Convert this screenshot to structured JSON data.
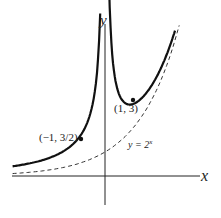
{
  "chart_data": {
    "type": "line",
    "title": "",
    "xlabel": "x",
    "ylabel": "y",
    "grid": false,
    "series": [
      {
        "name": "y = 2^x + 1/x",
        "style": "solid",
        "x": [
          -3.2,
          -3,
          -2.5,
          -2,
          -1.5,
          -1,
          -0.7,
          -0.5,
          -0.35,
          -0.25,
          0.15,
          0.2,
          0.3,
          0.5,
          0.75,
          1,
          1.5,
          2,
          2.3,
          2.55
        ],
        "y": [
          -0.2,
          -0.21,
          -0.22,
          -0.25,
          -0.31,
          -0.5,
          -0.81,
          -1.29,
          -2.07,
          -3.16,
          7.78,
          6.15,
          4.57,
          3.41,
          3.01,
          3,
          3.49,
          4.5,
          5.36,
          6.2
        ]
      },
      {
        "name": "y = 2^x",
        "style": "dashed",
        "x": [
          -3.2,
          -2,
          -1,
          0,
          1,
          2,
          2.65
        ],
        "y": [
          0.11,
          0.25,
          0.5,
          1,
          2,
          4,
          6.28
        ]
      }
    ],
    "annotations": [
      {
        "text": "(1, 3)",
        "x": 1,
        "y": 3
      },
      {
        "text": "(−1, 3/2)",
        "x": -1,
        "y": 1.5
      },
      {
        "text": "y = 2^x",
        "label_for": "dashed"
      }
    ]
  },
  "labels": {
    "x_axis": "x",
    "y_axis": "y",
    "point1": "(1, 3)",
    "point2": "(−1, 3/2)",
    "curve_label_base": "y = 2",
    "curve_label_exp": "x"
  }
}
